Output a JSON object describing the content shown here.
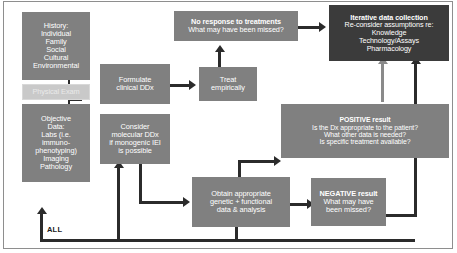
{
  "diagram": {
    "colors": {
      "box_gray": "#808080",
      "box_dark": "#3b3b3b",
      "box_light": "#c9c9c9",
      "connector": "#2b2b2b",
      "connector_gray": "#8a8a8a",
      "text_on_box": "#ffffff",
      "background": "#ffffff",
      "frame_border": "#8e8e8e"
    },
    "nodes": [
      {
        "id": "history",
        "style": "gray",
        "text": "History:\nIndividual\nFamily\nSocial\nCultural\nEnvironmental"
      },
      {
        "id": "physical-exam",
        "style": "light",
        "text": "Physical Exam"
      },
      {
        "id": "objective-data",
        "style": "gray",
        "text": "Objective\nData:\nLabs (i.e.\nimmuno-\nphenotyping)\nImaging\nPathology"
      },
      {
        "id": "formulate-clinical-ddx",
        "style": "gray",
        "text": "Formulate\nclinical DDx"
      },
      {
        "id": "consider-molecular-ddx",
        "style": "gray",
        "text": "Consider\nmolecular DDx\nif monogenic IEI\nis possible"
      },
      {
        "id": "treat-empirically",
        "style": "gray",
        "text": "Treat\nempirically"
      },
      {
        "id": "no-response",
        "style": "gray",
        "head": "No response to treatments",
        "text": "What may have been missed?"
      },
      {
        "id": "iterative-data-collection",
        "style": "dark",
        "head": "Iterative data collection",
        "text": "Re-consider assumptions re:\nKnowledge\nTechnology/Assays\nPharmacology"
      },
      {
        "id": "positive-result",
        "style": "gray",
        "head": "POSITIVE result",
        "text": "Is the Dx appropriate to the patient?\nWhat other data is needed?\nIs specific treatment available?"
      },
      {
        "id": "obtain-genetic-data",
        "style": "gray",
        "text": "Obtain appropriate\ngenetic + functional\ndata & analysis"
      },
      {
        "id": "negative-result",
        "style": "gray",
        "head": "NEGATIVE result",
        "text": "What may have\nbeen missed?"
      }
    ],
    "labels": {
      "all": "ALL"
    }
  }
}
